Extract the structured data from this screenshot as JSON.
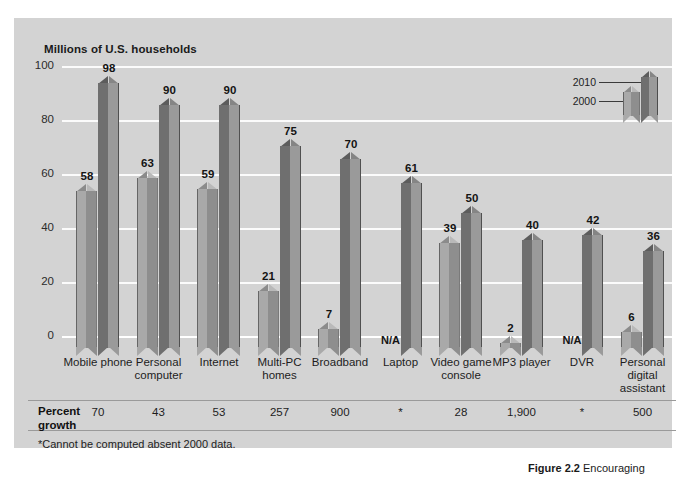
{
  "figure": {
    "caption_label": "Figure 2.2",
    "caption_text": "Encouraging"
  },
  "chart_data": {
    "type": "bar",
    "title": "",
    "ylabel": "Millions of U.S. households",
    "xlabel": "",
    "ylim": [
      0,
      100
    ],
    "yticks": [
      0,
      20,
      40,
      60,
      80,
      100
    ],
    "ytick_labels": [
      "0",
      "20",
      "40",
      "60",
      "80",
      "100"
    ],
    "grid": true,
    "legend_position": "top-right",
    "categories": [
      "Mobile phone",
      "Personal computer",
      "Internet",
      "Multi-PC homes",
      "Broadband",
      "Laptop",
      "Video game console",
      "MP3 player",
      "DVR",
      "Personal digital assistant"
    ],
    "series": [
      {
        "name": "2000",
        "color": "#a9a9a9",
        "values": [
          58,
          63,
          59,
          21,
          7,
          null,
          39,
          2,
          null,
          6
        ],
        "labels": [
          "58",
          "63",
          "59",
          "21",
          "7",
          "N/A",
          "39",
          "2",
          "N/A",
          "6"
        ]
      },
      {
        "name": "2010",
        "color": "#6f6f6f",
        "values": [
          98,
          90,
          90,
          75,
          70,
          61,
          50,
          40,
          42,
          36
        ],
        "labels": [
          "98",
          "90",
          "90",
          "75",
          "70",
          "61",
          "50",
          "40",
          "42",
          "36"
        ]
      }
    ],
    "percent_growth": {
      "row_label": "Percent growth",
      "values": [
        "70",
        "43",
        "53",
        "257",
        "900",
        "*",
        "28",
        "1,900",
        "*",
        "500"
      ]
    },
    "footnote": "*Cannot be computed absent 2000 data."
  }
}
